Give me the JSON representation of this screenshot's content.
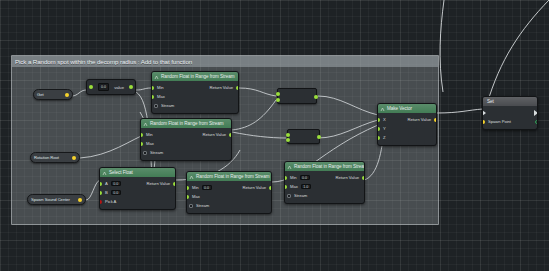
{
  "app": {
    "editor": "Blueprint Graph Editor",
    "canvas_background": "#1e2225",
    "wire_color": "#e6eaec"
  },
  "comment": {
    "title": "Pick a Random spot within the decomp radius : Add to that function",
    "color": "#abb2b6"
  },
  "nodes": {
    "value_entry": {
      "name": "value-entry-node",
      "value": "0.0",
      "label": "value"
    },
    "random_float_1": {
      "title": "Random Float in Range from Stream",
      "inputs": [
        {
          "label": "Min",
          "type": "float",
          "color": "#9ade3b"
        },
        {
          "label": "Max",
          "type": "float",
          "color": "#9ade3b"
        },
        {
          "label": "Stream",
          "type": "struct",
          "color": "#1fc2d7"
        }
      ],
      "outputs": [
        {
          "label": "Return Value",
          "type": "float",
          "color": "#9ade3b"
        }
      ]
    },
    "random_float_2": {
      "title": "Random Float in Range from Stream",
      "inputs": [
        {
          "label": "Min",
          "type": "float",
          "color": "#9ade3b"
        },
        {
          "label": "Max",
          "type": "float",
          "color": "#9ade3b"
        },
        {
          "label": "Stream",
          "type": "struct",
          "color": "#1fc2d7"
        }
      ],
      "outputs": [
        {
          "label": "Return Value",
          "type": "float",
          "color": "#9ade3b"
        }
      ]
    },
    "random_float_3": {
      "title": "Random Float in Range from Stream",
      "inputs": [
        {
          "label": "Min",
          "type": "float",
          "value": "0.0",
          "color": "#9ade3b"
        },
        {
          "label": "Max",
          "type": "float",
          "color": "#9ade3b"
        },
        {
          "label": "Stream",
          "type": "struct",
          "color": "#1fc2d7"
        }
      ],
      "outputs": [
        {
          "label": "Return Value",
          "type": "float",
          "color": "#9ade3b"
        }
      ]
    },
    "random_float_4": {
      "title": "Random Float in Range from Stream",
      "inputs": [
        {
          "label": "Min",
          "type": "float",
          "value": "0.0",
          "color": "#9ade3b"
        },
        {
          "label": "Max",
          "type": "float",
          "value": "1.0",
          "color": "#9ade3b"
        },
        {
          "label": "Stream",
          "type": "struct",
          "color": "#1fc2d7"
        }
      ],
      "outputs": [
        {
          "label": "Return Value",
          "type": "float",
          "color": "#9ade3b"
        }
      ]
    },
    "select_float": {
      "title": "Select Float",
      "inputs": [
        {
          "label": "A",
          "type": "float",
          "value": "0.0",
          "color": "#9ade3b"
        },
        {
          "label": "B",
          "type": "float",
          "value": "0.0",
          "color": "#9ade3b"
        },
        {
          "label": "Pick A",
          "type": "bool",
          "color": "#b31414"
        }
      ],
      "outputs": [
        {
          "label": "Return Value",
          "type": "float",
          "color": "#9ade3b"
        }
      ]
    },
    "make_vector": {
      "title": "Make Vector",
      "inputs": [
        {
          "label": "X",
          "type": "float",
          "color": "#9ade3b"
        },
        {
          "label": "Y",
          "type": "float",
          "color": "#9ade3b"
        },
        {
          "label": "Z",
          "type": "float",
          "color": "#9ade3b"
        }
      ],
      "outputs": [
        {
          "label": "Return Value",
          "type": "vector",
          "color": "#f5d22c"
        }
      ]
    },
    "spawn_point": {
      "title": "Set",
      "inputs": [
        {
          "label": "Spawn Point",
          "type": "vector",
          "color": "#f5d22c"
        }
      ],
      "outputs": [
        {
          "label": "",
          "type": "vector",
          "color": "#f5d22c"
        }
      ]
    },
    "math_multiply": {
      "name": "multiply-node",
      "label": "",
      "inputs": 2,
      "outputs": 1
    },
    "math_add": {
      "name": "add-node",
      "label": "",
      "inputs": 2,
      "outputs": 1
    }
  },
  "variables": [
    {
      "label": "Rotation Root",
      "color": "#f5d22c"
    },
    {
      "label": "Spawn Sound Center",
      "color": "#f5d22c"
    }
  ],
  "small_nodes": {
    "left_get": {
      "label": "Get",
      "color": "#3a3e42"
    }
  }
}
